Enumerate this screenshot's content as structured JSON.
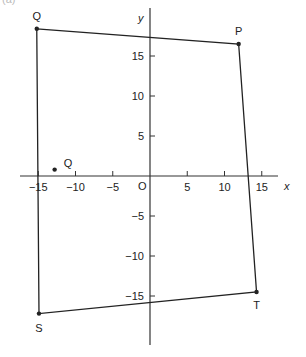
{
  "caption": "(a)",
  "axes": {
    "x_label": "x",
    "y_label": "y",
    "origin_label": "O",
    "x_ticks": [
      {
        "value": -15,
        "label": "−15"
      },
      {
        "value": -10,
        "label": "−10"
      },
      {
        "value": -5,
        "label": "−5"
      },
      {
        "value": 5,
        "label": "5"
      },
      {
        "value": 10,
        "label": "10"
      },
      {
        "value": 15,
        "label": "15"
      }
    ],
    "y_ticks": [
      {
        "value": 15,
        "label": "15"
      },
      {
        "value": 10,
        "label": "10"
      },
      {
        "value": 5,
        "label": "5"
      },
      {
        "value": -5,
        "label": "−5"
      },
      {
        "value": -10,
        "label": "−10"
      },
      {
        "value": -15,
        "label": "−15"
      }
    ],
    "x_range": [
      -17,
      18
    ],
    "y_range": [
      -20,
      21
    ]
  },
  "points": [
    {
      "id": "Q_top",
      "label": "Q",
      "x": -15.2,
      "y": 18.4
    },
    {
      "id": "P",
      "label": "P",
      "x": 11.9,
      "y": 16.5
    },
    {
      "id": "T",
      "label": "T",
      "x": 14.3,
      "y": -14.5
    },
    {
      "id": "S",
      "label": "S",
      "x": -14.9,
      "y": -17.2
    },
    {
      "id": "Q_mid",
      "label": "Q",
      "x": -12.8,
      "y": 0.8
    }
  ],
  "polygon_order": [
    "Q_top",
    "P",
    "T",
    "S",
    "Q_top"
  ],
  "colors": {
    "line": "#222222",
    "axis": "#333333",
    "text": "#222222"
  }
}
